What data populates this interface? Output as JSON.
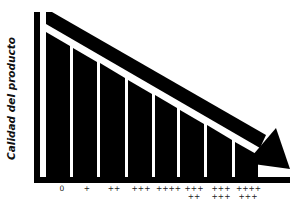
{
  "diagram": {
    "y_axis_label": "Calidad del producto",
    "x_labels": [
      {
        "line1": "0",
        "line2": ""
      },
      {
        "line1": "+",
        "line2": ""
      },
      {
        "line1": "++",
        "line2": ""
      },
      {
        "line1": "+++",
        "line2": ""
      },
      {
        "line1": "++++",
        "line2": ""
      },
      {
        "line1": "+++",
        "line2": "++"
      },
      {
        "line1": "+++",
        "line2": "+++"
      },
      {
        "line1": "++++",
        "line2": "+++"
      }
    ],
    "colors": {
      "ink": "#000000",
      "background": "#ffffff"
    },
    "arrow": "descending-trend-arrow",
    "bars_count": 8
  }
}
